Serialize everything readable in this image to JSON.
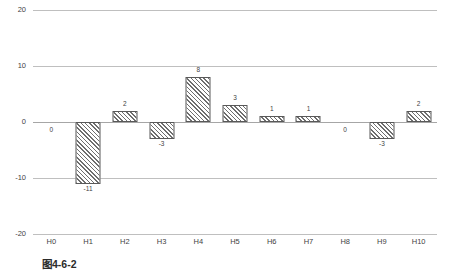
{
  "caption": "图4-6-2",
  "chart_data": {
    "type": "bar",
    "title": "",
    "subtitle": "",
    "xlabel": "",
    "ylabel": "",
    "categories": [
      "H0",
      "H1",
      "H2",
      "H3",
      "H4",
      "H5",
      "H6",
      "H7",
      "H8",
      "H9",
      "H10"
    ],
    "values": [
      0,
      -11,
      2,
      -3,
      8,
      3,
      1,
      1,
      0,
      -3,
      2
    ],
    "data_labels": [
      "0",
      "-11",
      "2",
      "-3",
      "8",
      "3",
      "1",
      "1",
      "0",
      "-3",
      "2"
    ],
    "ylim": [
      -20,
      20
    ],
    "yticks": [
      20,
      10,
      0,
      -10,
      -20
    ],
    "ytick_labels": [
      "20",
      "10",
      "0",
      "-10",
      "-20"
    ],
    "grid": true,
    "grid_axis": "y",
    "legend": false,
    "legend_position": "none",
    "bar_fill": "diagonal-hatch",
    "colors": {
      "bar_border": "#595959",
      "bar_hatch": "#6e6e6e",
      "bar_background": "#ffffff",
      "gridline": "#bfbfbf",
      "zero_line": "#a6a6a6",
      "text": "#3f3f3f",
      "plot_background": "#ffffff"
    }
  }
}
